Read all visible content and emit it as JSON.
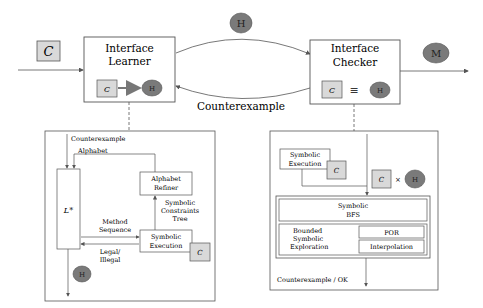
{
  "colors": {
    "stroke": "#555555",
    "box_fill": "#ffffff",
    "c_fill": "#d9d9d9",
    "h_fill": "#7a7a7a",
    "text": "#222222"
  },
  "top": {
    "input_symbol": "C",
    "hypothesis_symbol": "H",
    "output_symbol": "M",
    "counterexample_label": "Counterexample",
    "learner": {
      "title_line1": "Interface",
      "title_line2": "Learner",
      "c_symbol": "C",
      "h_symbol": "H"
    },
    "checker": {
      "title_line1": "Interface",
      "title_line2": "Checker",
      "c_symbol": "C",
      "equiv_symbol": "≡",
      "h_symbol": "H"
    }
  },
  "learner_detail": {
    "counterexample_label": "Counterexample",
    "alphabet_label": "Alphabet",
    "lstar_label": "L*",
    "alphabet_refiner_line1": "Alphabet",
    "alphabet_refiner_line2": "Refiner",
    "symbolic_tree_line1": "Symbolic",
    "symbolic_tree_line2": "Constraints",
    "symbolic_tree_line3": "Tree",
    "method_sequence_line1": "Method",
    "method_sequence_line2": "Sequence",
    "legal_line1": "Legal/",
    "legal_line2": "Illegal",
    "symexec_line1": "Symbolic",
    "symexec_line2": "Execution",
    "c_symbol": "C",
    "h_symbol": "H"
  },
  "checker_detail": {
    "symexec_line1": "Symbolic",
    "symexec_line2": "Execution",
    "c_symbol": "C",
    "product_c": "C",
    "times": "×",
    "product_h": "H",
    "bfs_line1": "Symbolic",
    "bfs_line2": "BFS",
    "bounded_line1": "Bounded",
    "bounded_line2": "Symbolic",
    "bounded_line3": "Exploration",
    "por_label": "POR",
    "interpolation_label": "Interpolation",
    "result_label": "Counterexample / OK"
  }
}
